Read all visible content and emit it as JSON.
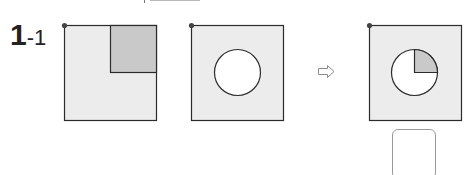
{
  "problem": {
    "number": "1",
    "sub_number": "-1"
  },
  "colors": {
    "square_fill": "#ececec",
    "shaded_fill": "#c9c9c9",
    "stroke": "#2b2b2b",
    "dot": "#444444",
    "arrow": "#8c8c8c"
  },
  "figures": [
    {
      "name": "square-with-shaded-quarter",
      "description": "square with shaded top-right quarter"
    },
    {
      "name": "square-with-circle",
      "description": "square with white circle in center"
    },
    {
      "name": "square-with-circle-shaded-quarter",
      "description": "square with circle whose top-right quarter is shaded"
    }
  ],
  "arrow_icon": "⇨",
  "answer_box": ""
}
